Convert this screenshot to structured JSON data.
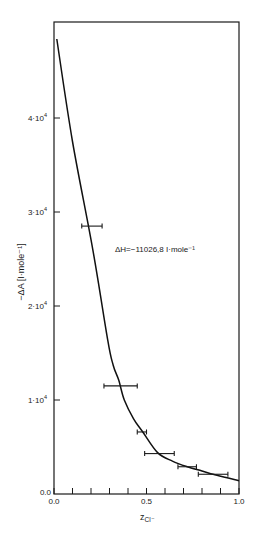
{
  "chart_data": {
    "type": "line",
    "title": "",
    "xlabel": "z",
    "xlabel_sub": "Cl⁻",
    "ylabel": "−ΔA  [I·mole⁻¹]",
    "xlim": [
      0.0,
      1.0
    ],
    "ylim": [
      0,
      50000
    ],
    "grid": false,
    "x_ticks": [
      0.0,
      0.1,
      0.2,
      0.3,
      0.4,
      0.5,
      0.6,
      0.7,
      0.8,
      0.9,
      1.0
    ],
    "x_tick_labels": [
      {
        "value": 0.0,
        "label": "0.0"
      },
      {
        "value": 0.5,
        "label": "0.5"
      },
      {
        "value": 1.0,
        "label": "1.0"
      }
    ],
    "y_ticks": [
      {
        "value": 0,
        "label": "0.0"
      },
      {
        "value": 10000,
        "label": "1·10",
        "exp": "4"
      },
      {
        "value": 20000,
        "label": "2·10",
        "exp": "4"
      },
      {
        "value": 30000,
        "label": "3·10",
        "exp": "4"
      },
      {
        "value": 40000,
        "label": "4·10",
        "exp": "4"
      }
    ],
    "annotation": "ΔH=−11026,8  I·mole⁻¹",
    "series": [
      {
        "name": "fitted curve",
        "style": "line",
        "x": [
          0.015,
          0.1,
          0.21,
          0.29,
          0.32,
          0.35,
          0.38,
          0.43,
          0.48,
          0.56,
          0.64,
          0.72,
          0.8,
          0.86,
          0.93,
          1.0
        ],
        "y": [
          48400,
          37500,
          26000,
          16400,
          13700,
          12100,
          10000,
          8000,
          6600,
          4400,
          3500,
          2900,
          2450,
          2100,
          1750,
          1400
        ]
      },
      {
        "name": "measurements",
        "style": "errorbar-x",
        "points": [
          {
            "x": 0.2,
            "xmin": 0.15,
            "xmax": 0.26,
            "y": 28500
          },
          {
            "x": 0.35,
            "xmin": 0.27,
            "xmax": 0.45,
            "y": 11500
          },
          {
            "x": 0.47,
            "xmin": 0.45,
            "xmax": 0.5,
            "y": 6600
          },
          {
            "x": 0.57,
            "xmin": 0.49,
            "xmax": 0.65,
            "y": 4300
          },
          {
            "x": 0.72,
            "xmin": 0.67,
            "xmax": 0.77,
            "y": 2900
          },
          {
            "x": 0.86,
            "xmin": 0.78,
            "xmax": 0.94,
            "y": 2100
          }
        ]
      }
    ]
  }
}
